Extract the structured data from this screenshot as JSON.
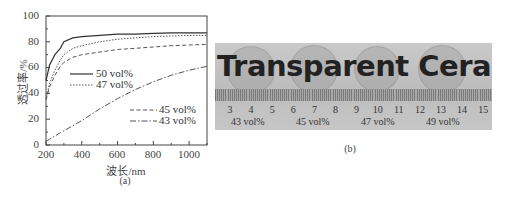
{
  "panel_a": {
    "caption": "(a)",
    "ylabel": "透过率/%",
    "xlabel": "波长/nm",
    "yticks": [
      "0",
      "20",
      "40",
      "60",
      "80",
      "100"
    ],
    "xticks": [
      "200",
      "400",
      "600",
      "800",
      "1000"
    ],
    "legend": [
      "50 vol%",
      "47 vol%",
      "45 vol%",
      "43 vol%"
    ]
  },
  "panel_b": {
    "caption": "(b)",
    "banner_text": "Transparent Ceramics",
    "ruler_numbers": [
      "3",
      "4",
      "5",
      "6",
      "7",
      "8",
      "9",
      "10",
      "11",
      "12",
      "13",
      "14",
      "15"
    ],
    "sample_labels": [
      "43 vol%",
      "45 vol%",
      "47 vol%",
      "49 vol%"
    ]
  },
  "chart_data": {
    "type": "line",
    "title": "",
    "xlabel": "波长/nm",
    "ylabel": "透过率/%",
    "xlim": [
      200,
      1100
    ],
    "ylim": [
      0,
      100
    ],
    "grid": false,
    "legend_position": "inside, middle",
    "x": [
      200,
      220,
      250,
      280,
      300,
      350,
      400,
      500,
      600,
      700,
      800,
      900,
      1000,
      1100
    ],
    "series": [
      {
        "name": "50 vol%",
        "style": "solid",
        "values": [
          50,
          62,
          70,
          75,
          80,
          83,
          84,
          85,
          86,
          86,
          86.5,
          87,
          87,
          87
        ]
      },
      {
        "name": "47 vol%",
        "style": "dotted",
        "values": [
          36,
          48,
          58,
          66,
          70,
          75,
          77,
          80,
          82,
          83,
          84,
          84.5,
          85,
          85
        ]
      },
      {
        "name": "45 vol%",
        "style": "dashed",
        "values": [
          35,
          45,
          54,
          61,
          64,
          68,
          70,
          72,
          74,
          75,
          76,
          77,
          77.5,
          78
        ]
      },
      {
        "name": "43 vol%",
        "style": "dash-dot",
        "values": [
          3,
          4.5,
          7,
          9.5,
          11,
          15,
          19,
          28,
          36,
          43,
          49,
          54,
          58,
          61
        ]
      }
    ]
  }
}
